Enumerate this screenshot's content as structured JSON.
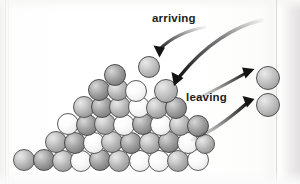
{
  "figure": {
    "background_color": "#fbfbfa"
  },
  "labels": {
    "arriving": "arriving",
    "leaving": "leaving"
  },
  "colors": {
    "sphere_dark": "#8a8a8a",
    "sphere_light": "#f6f6f6",
    "sphere_outline": "#4a4a4a",
    "arrow": "#2b2b2b",
    "text": "#1d1d1d",
    "page": "#fbfbfa"
  },
  "arrows": [
    {
      "name": "arriving-arrow-1",
      "direction": "down-left",
      "from": [
        205,
        28
      ],
      "to": [
        155,
        55
      ],
      "label": "arriving"
    },
    {
      "name": "arriving-arrow-2",
      "direction": "down-left",
      "from": [
        258,
        22
      ],
      "to": [
        172,
        86
      ],
      "label": "arriving"
    },
    {
      "name": "leaving-arrow-1",
      "direction": "up-right",
      "from": [
        196,
        96
      ],
      "to": [
        252,
        70
      ],
      "label": "leaving"
    },
    {
      "name": "leaving-arrow-2",
      "direction": "up-right",
      "from": [
        198,
        134
      ],
      "to": [
        252,
        104
      ],
      "label": "leaving"
    }
  ],
  "spheres": {
    "free": [
      {
        "name": "free-sphere-arriving-1",
        "cx": 149,
        "cy": 67,
        "r": 11,
        "shade": "free"
      },
      {
        "name": "free-sphere-arriving-2",
        "cx": 166,
        "cy": 91,
        "r": 12,
        "shade": "free"
      },
      {
        "name": "free-sphere-leaving-1",
        "cx": 268,
        "cy": 78,
        "r": 12,
        "shade": "free"
      },
      {
        "name": "free-sphere-leaving-2",
        "cx": 268,
        "cy": 105,
        "r": 12,
        "shade": "free"
      }
    ],
    "cluster": [
      {
        "cx": 24,
        "cy": 160,
        "r": 11,
        "shade": "mid"
      },
      {
        "cx": 44,
        "cy": 160,
        "r": 11,
        "shade": "dark"
      },
      {
        "cx": 63,
        "cy": 161,
        "r": 11,
        "shade": "mid"
      },
      {
        "cx": 81,
        "cy": 161,
        "r": 11,
        "shade": "light"
      },
      {
        "cx": 100,
        "cy": 160,
        "r": 11,
        "shade": "dark"
      },
      {
        "cx": 119,
        "cy": 161,
        "r": 11,
        "shade": "mid"
      },
      {
        "cx": 140,
        "cy": 161,
        "r": 11,
        "shade": "light"
      },
      {
        "cx": 159,
        "cy": 161,
        "r": 11,
        "shade": "light"
      },
      {
        "cx": 178,
        "cy": 161,
        "r": 11,
        "shade": "mid"
      },
      {
        "cx": 198,
        "cy": 160,
        "r": 11,
        "shade": "light"
      },
      {
        "cx": 56,
        "cy": 142,
        "r": 11,
        "shade": "mid"
      },
      {
        "cx": 75,
        "cy": 143,
        "r": 11,
        "shade": "dark"
      },
      {
        "cx": 94,
        "cy": 143,
        "r": 11,
        "shade": "light"
      },
      {
        "cx": 112,
        "cy": 142,
        "r": 11,
        "shade": "mid"
      },
      {
        "cx": 131,
        "cy": 143,
        "r": 11,
        "shade": "dark"
      },
      {
        "cx": 150,
        "cy": 143,
        "r": 11,
        "shade": "mid"
      },
      {
        "cx": 169,
        "cy": 142,
        "r": 11,
        "shade": "dark"
      },
      {
        "cx": 188,
        "cy": 143,
        "r": 11,
        "shade": "light"
      },
      {
        "cx": 205,
        "cy": 144,
        "r": 10,
        "shade": "mid"
      },
      {
        "cx": 68,
        "cy": 124,
        "r": 11,
        "shade": "light"
      },
      {
        "cx": 87,
        "cy": 125,
        "r": 11,
        "shade": "dark"
      },
      {
        "cx": 105,
        "cy": 124,
        "r": 11,
        "shade": "mid"
      },
      {
        "cx": 124,
        "cy": 125,
        "r": 11,
        "shade": "light"
      },
      {
        "cx": 143,
        "cy": 124,
        "r": 11,
        "shade": "dark"
      },
      {
        "cx": 161,
        "cy": 125,
        "r": 11,
        "shade": "light"
      },
      {
        "cx": 180,
        "cy": 125,
        "r": 11,
        "shade": "mid"
      },
      {
        "cx": 198,
        "cy": 126,
        "r": 11,
        "shade": "dark"
      },
      {
        "cx": 84,
        "cy": 107,
        "r": 11,
        "shade": "mid"
      },
      {
        "cx": 102,
        "cy": 107,
        "r": 11,
        "shade": "dark"
      },
      {
        "cx": 120,
        "cy": 107,
        "r": 11,
        "shade": "mid"
      },
      {
        "cx": 139,
        "cy": 107,
        "r": 11,
        "shade": "light"
      },
      {
        "cx": 157,
        "cy": 108,
        "r": 11,
        "shade": "mid"
      },
      {
        "cx": 176,
        "cy": 108,
        "r": 11,
        "shade": "dark"
      },
      {
        "cx": 99,
        "cy": 90,
        "r": 11,
        "shade": "dark"
      },
      {
        "cx": 118,
        "cy": 90,
        "r": 11,
        "shade": "mid"
      },
      {
        "cx": 136,
        "cy": 91,
        "r": 11,
        "shade": "light"
      },
      {
        "cx": 115,
        "cy": 75,
        "r": 11,
        "shade": "dark"
      }
    ]
  }
}
